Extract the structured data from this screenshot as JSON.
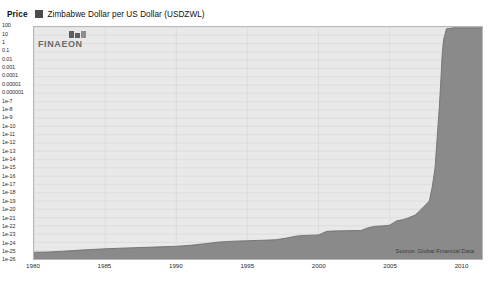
{
  "header": {
    "price_label": "Price",
    "series_label": "Zimbabwe Dollar per US Dollar (USDZWL)",
    "swatch_color": "#4c4c4c"
  },
  "brand": {
    "wordmark": "FINAEON"
  },
  "footer": {
    "source": "Source: Global Financial Data"
  },
  "chart_data": {
    "type": "area",
    "title": "Zimbabwe Dollar per US Dollar (USDZWL)",
    "subtitle": "",
    "xlabel": "",
    "ylabel": "Price",
    "yscale": "log",
    "grid": true,
    "legend_position": "top-left",
    "xlim": [
      1980,
      2011.5
    ],
    "ylim": [
      1e-26,
      100
    ],
    "xticks": [
      1980,
      1985,
      1990,
      1995,
      2000,
      2005,
      2010
    ],
    "xticklabels": [
      "1980",
      "1985",
      "1990",
      "1995",
      "2000",
      "2005",
      "2010"
    ],
    "yticks": [
      100,
      10,
      1,
      0.1,
      0.01,
      0.001,
      0.0001,
      1e-05,
      1e-06,
      1e-07,
      1e-08,
      1e-09,
      1e-10,
      1e-11,
      1e-12,
      1e-13,
      1e-14,
      1e-15,
      1e-16,
      1e-17,
      1e-18,
      1e-19,
      1e-20,
      1e-21,
      1e-22,
      1e-23,
      1e-24,
      1e-25,
      1e-26
    ],
    "yticklabels": [
      "100",
      "10",
      "1",
      "0.1",
      "0.01",
      "0.001",
      "0.0001",
      "0.00001",
      "0.000001",
      "1e-7",
      "1e-8",
      "1e-9",
      "1e-10",
      "1e-11",
      "1e-12",
      "1e-13",
      "1e-14",
      "1e-15",
      "1e-16",
      "1e-17",
      "1e-18",
      "1e-19",
      "1e-20",
      "1e-21",
      "1e-22",
      "1e-23",
      "1e-24",
      "1e-25",
      "1e-26"
    ],
    "fill_color": "#8a8a8a",
    "line_color": "#6f6f6f",
    "plot_background": "#e9e9e9",
    "series": [
      {
        "name": "Zimbabwe Dollar per US Dollar (USDZWL)",
        "x": [
          1980.0,
          1981.0,
          1982.0,
          1983.0,
          1984.0,
          1985.0,
          1986.0,
          1987.0,
          1988.0,
          1989.0,
          1990.0,
          1991.0,
          1992.0,
          1993.0,
          1994.0,
          1995.0,
          1996.0,
          1997.0,
          1997.8,
          1998.5,
          1999.0,
          2000.0,
          2000.6,
          2001.0,
          2002.0,
          2003.0,
          2003.5,
          2004.0,
          2004.6,
          2005.0,
          2005.5,
          2006.0,
          2006.3,
          2006.8,
          2007.0,
          2007.4,
          2007.8,
          2008.0,
          2008.2,
          2008.35,
          2008.5,
          2008.62,
          2008.7,
          2008.8,
          2009.0,
          2009.5,
          2010.0,
          2010.5,
          2011.0,
          2011.5
        ],
        "y": [
          6.5e-26,
          7e-26,
          8.5e-26,
          1.1e-25,
          1.4e-25,
          1.7e-25,
          2e-25,
          2.3e-25,
          2.6e-25,
          3e-25,
          3.4e-25,
          4.5e-25,
          7e-25,
          1.1e-24,
          1.4e-24,
          1.6e-24,
          1.8e-24,
          2.1e-24,
          3.5e-24,
          6e-24,
          7e-24,
          8e-24,
          2.2e-23,
          2.4e-23,
          2.6e-23,
          2.8e-23,
          6e-23,
          9e-23,
          1e-22,
          1.2e-22,
          4e-22,
          6e-22,
          9e-22,
          2e-21,
          4e-21,
          2e-20,
          1e-19,
          5e-18,
          1e-15,
          5e-12,
          2e-08,
          0.0001,
          0.05,
          3.0,
          60.0,
          80.0,
          80.0,
          80.0,
          80.0,
          80.0
        ]
      }
    ]
  }
}
